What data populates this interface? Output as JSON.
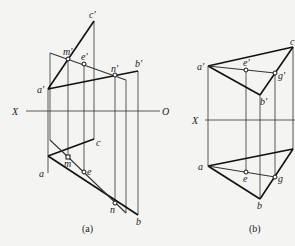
{
  "figure_a": {
    "caption": "(a)",
    "axis": {
      "left_label": "X",
      "right_label": "O"
    },
    "labels": {
      "a_prime": "a'",
      "b_prime": "b'",
      "c_prime": "c'",
      "m_prime": "m'",
      "e_prime": "e'",
      "n_prime": "n'",
      "a": "a",
      "b": "b",
      "c": "c",
      "m": "m",
      "e": "e",
      "n": "n"
    }
  },
  "figure_b": {
    "caption": "(b)",
    "axis": {
      "left_label": "X"
    },
    "labels": {
      "a_prime": "a'",
      "b_prime": "b'",
      "c_prime": "c'",
      "e_prime": "e'",
      "g_prime": "g'",
      "a": "a",
      "b": "b",
      "e": "e",
      "g": "g"
    }
  }
}
